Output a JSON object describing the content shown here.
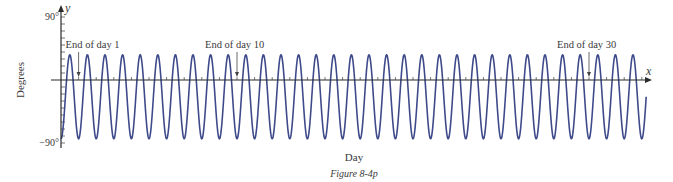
{
  "chart_data": {
    "type": "line",
    "title": "",
    "caption": "Figure 8-4p",
    "xlabel": "Day",
    "ylabel": "Degrees",
    "x_axis_symbol": "x",
    "y_axis_symbol": "y",
    "y_tick_labels": [
      "90°",
      "−90°"
    ],
    "ylim": [
      -90,
      90
    ],
    "xlim": [
      0,
      33.4
    ],
    "y_tick_step": 10,
    "x_tick_step": 1,
    "grid": false,
    "legend": null,
    "series": [
      {
        "name": "temperature-angle",
        "formula": "y = -24 - 60*cos(2*pi*x)",
        "midline": -24,
        "amplitude": 60,
        "period": 1,
        "x_start": 0,
        "x_end": 33.25,
        "peak_value": 36,
        "trough_value": -84
      }
    ],
    "annotations": [
      {
        "label": "End of day 1",
        "x": 1
      },
      {
        "label": "End of day 10",
        "x": 10
      },
      {
        "label": "End of day 30",
        "x": 30
      }
    ]
  },
  "colors": {
    "curve": "#3f4a8a",
    "axis": "#2b2b2b",
    "text": "#3a3a3a"
  },
  "layout": {
    "origin_x": 61,
    "origin_y": 80,
    "px_per_day": 17.6,
    "px_per_degree": 0.7,
    "y_axis_top": 5,
    "y_axis_bottom": 148,
    "x_axis_right": 652
  }
}
